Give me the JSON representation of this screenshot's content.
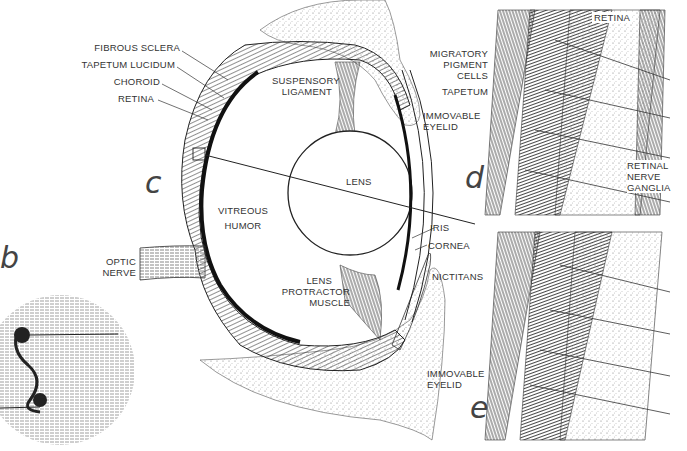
{
  "figure": {
    "panels": {
      "b": "b",
      "c": "c",
      "d": "d",
      "e": "e"
    },
    "labels": {
      "fibrous_sclera": "FIBROUS SCLERA",
      "tapetum_lucidum": "TAPETUM LUCIDUM",
      "choroid": "CHOROID",
      "retina": "RETINA",
      "suspensory_ligament": [
        "SUSPENSORY",
        "LIGAMENT"
      ],
      "lens": "LENS",
      "vitreous_humor": [
        "VITREOUS",
        "HUMOR"
      ],
      "optic_nerve": [
        "OPTIC",
        "NERVE"
      ],
      "immovable_eyelid_top": [
        "IMMOVABLE",
        "EYELID"
      ],
      "iris": "IRIS",
      "cornea": "CORNEA",
      "nictitans": "NICTITANS",
      "lens_protractor_muscle": [
        "LENS",
        "PROTRACTOR",
        "MUSCLE"
      ],
      "immovable_eyelid_bottom": [
        "IMMOVABLE",
        "EYELID"
      ],
      "migratory_pigment_cells": [
        "MIGRATORY",
        "PIGMENT",
        "CELLS"
      ],
      "tapetum": "TAPETUM",
      "retina_detail": "RETINA",
      "retinal_nerve_ganglia": [
        "RETINAL",
        "NERVE",
        "GANGLIA"
      ]
    },
    "colors": {
      "ink": "#222222",
      "paper": "#ffffff",
      "stipple": "#9a9a9a"
    }
  }
}
